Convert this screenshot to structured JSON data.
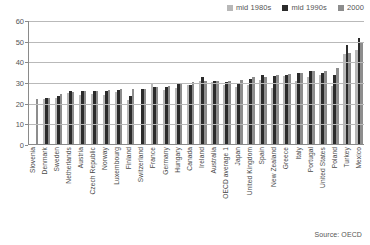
{
  "chart_data": {
    "type": "bar",
    "title": "",
    "subtitle": "",
    "xlabel": "",
    "ylabel": "",
    "ylim": [
      0,
      60
    ],
    "yticks": [
      0,
      10,
      20,
      30,
      40,
      50,
      60
    ],
    "grid": true,
    "legend_position": "top-right",
    "source_note": "Source: OECD",
    "categories": [
      "Slovenia",
      "Denmark",
      "Sweden",
      "Netherlands",
      "Austria",
      "Czech Republic",
      "Norway",
      "Luxembourg",
      "Finland",
      "Switzerland",
      "France",
      "Germany",
      "Hungary",
      "Canada",
      "Ireland",
      "Australia",
      "OECD average 1",
      "Japan",
      "United Kingdom",
      "Spain",
      "New Zealand",
      "Greece",
      "Italy",
      "Portugal",
      "United States",
      "Poland",
      "Turkey",
      "Mexico"
    ],
    "series": [
      {
        "name": "mid 1980s",
        "color": "#b8b8b8",
        "values": [
          null,
          22.0,
          22.5,
          24.5,
          23.5,
          24.0,
          23.5,
          25.0,
          21.5,
          null,
          29.0,
          26.0,
          27.0,
          28.5,
          30.5,
          30.0,
          28.5,
          27.5,
          28.5,
          31.0,
          27.0,
          33.0,
          30.5,
          32.5,
          33.5,
          28.0,
          43.5,
          45.5
        ]
      },
      {
        "name": "mid 1990s",
        "color": "#2b2b2b",
        "values": [
          null,
          22.5,
          23.0,
          25.5,
          25.5,
          25.5,
          25.5,
          26.0,
          23.0,
          26.5,
          27.5,
          27.5,
          29.5,
          28.5,
          32.5,
          30.5,
          30.0,
          29.5,
          31.5,
          33.5,
          33.0,
          33.5,
          34.5,
          35.5,
          34.5,
          33.5,
          48.0,
          51.5
        ]
      },
      {
        "name": "2000",
        "color": "#8d8d8d",
        "values": [
          22.0,
          22.5,
          24.0,
          25.0,
          25.5,
          25.5,
          26.0,
          26.5,
          26.5,
          26.5,
          27.5,
          28.0,
          29.5,
          30.0,
          30.5,
          30.5,
          30.5,
          31.0,
          32.5,
          32.5,
          33.5,
          34.0,
          34.5,
          35.5,
          35.5,
          37.0,
          44.0,
          49.5
        ]
      }
    ]
  },
  "legend": {
    "items": [
      {
        "label": "mid 1980s",
        "color": "#b8b8b8"
      },
      {
        "label": "mid 1990s",
        "color": "#2b2b2b"
      },
      {
        "label": "2000",
        "color": "#8d8d8d"
      }
    ]
  },
  "footer": {
    "source": "Source: OECD"
  }
}
